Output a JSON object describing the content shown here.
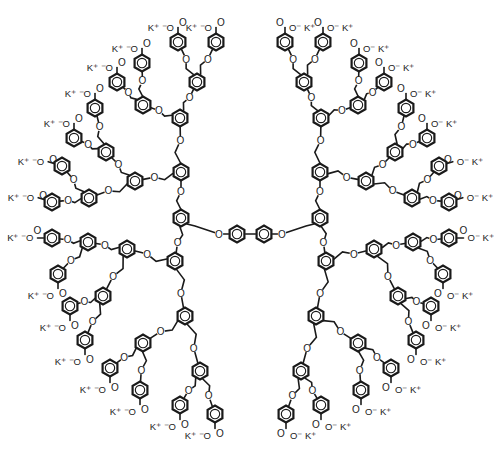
{
  "diagram": {
    "title": "",
    "type": "chemical-structure",
    "colors": {
      "line": "#1a1a1a",
      "background": "#ffffff"
    },
    "mirror_axis_x": 501,
    "core": {
      "rings": [
        {
          "x": 237,
          "y": 234
        },
        {
          "x": 264,
          "y": 234
        }
      ],
      "oxygens": [
        {
          "x": 219,
          "y": 234
        },
        {
          "x": 282,
          "y": 234
        }
      ],
      "atom_label": "O"
    },
    "labels": {
      "oxygen": "O",
      "carbonyl_oxygen": "O",
      "carboxylate": "O⁻",
      "counterion_left": "K⁺ ⁻O",
      "counterion_right": "O⁻ K⁺"
    },
    "left_half": {
      "focal_ring": {
        "x": 181,
        "y": 218
      },
      "branches": [
        {
          "name": "upper-left",
          "g2": {
            "x": 181,
            "y": 172
          },
          "g3": [
            {
              "x": 180,
              "y": 118,
              "g4": [
                {
                  "x": 197,
                  "y": 82,
                  "terminals": [
                    {
                      "x": 178,
                      "y": 42,
                      "dir": "up"
                    },
                    {
                      "x": 216,
                      "y": 42,
                      "dir": "up"
                    }
                  ]
                },
                {
                  "x": 143,
                  "y": 105,
                  "terminals": [
                    {
                      "x": 142,
                      "y": 63,
                      "dir": "up"
                    },
                    {
                      "x": 117,
                      "y": 82,
                      "dir": "up"
                    }
                  ]
                }
              ]
            },
            {
              "x": 135,
              "y": 181,
              "g4": [
                {
                  "x": 106,
                  "y": 152,
                  "terminals": [
                    {
                      "x": 95,
                      "y": 108,
                      "dir": "up"
                    },
                    {
                      "x": 74,
                      "y": 138,
                      "dir": "up"
                    }
                  ]
                },
                {
                  "x": 89,
                  "y": 198,
                  "terminals": [
                    {
                      "x": 62,
                      "y": 166,
                      "dir": "up"
                    },
                    {
                      "x": 52,
                      "y": 202,
                      "dir": "up"
                    }
                  ]
                }
              ]
            }
          ]
        },
        {
          "name": "lower-left",
          "g2": {
            "x": 175,
            "y": 261
          },
          "g3": [
            {
              "x": 127,
              "y": 249,
              "g4": [
                {
                  "x": 88,
                  "y": 242,
                  "terminals": [
                    {
                      "x": 52,
                      "y": 238,
                      "dir": "left"
                    },
                    {
                      "x": 58,
                      "y": 274,
                      "dir": "down"
                    }
                  ]
                },
                {
                  "x": 103,
                  "y": 296,
                  "terminals": [
                    {
                      "x": 70,
                      "y": 306,
                      "dir": "down"
                    },
                    {
                      "x": 85,
                      "y": 340,
                      "dir": "down"
                    }
                  ]
                }
              ]
            },
            {
              "x": 185,
              "y": 316,
              "g4": [
                {
                  "x": 143,
                  "y": 343,
                  "terminals": [
                    {
                      "x": 110,
                      "y": 368,
                      "dir": "down"
                    },
                    {
                      "x": 140,
                      "y": 390,
                      "dir": "down"
                    }
                  ]
                },
                {
                  "x": 200,
                  "y": 371,
                  "terminals": [
                    {
                      "x": 180,
                      "y": 405,
                      "dir": "down"
                    },
                    {
                      "x": 215,
                      "y": 414,
                      "dir": "down"
                    }
                  ]
                }
              ]
            }
          ]
        }
      ]
    },
    "counts": {
      "surface_groups": 32,
      "generations": 4
    }
  }
}
